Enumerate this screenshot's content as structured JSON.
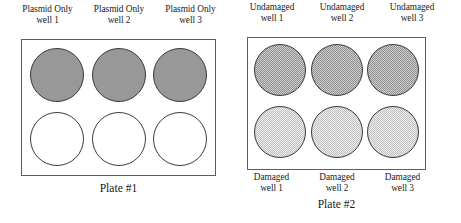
{
  "figure": {
    "type": "diagram",
    "background_color": "#ffffff"
  },
  "plate1": {
    "caption": "Plate #1",
    "border_color": "#5d5d5d",
    "headers": [
      {
        "line1": "Plasmid Only",
        "line2": "well 1"
      },
      {
        "line1": "Plasmid Only",
        "line2": "well 2"
      },
      {
        "line1": "Plasmid Only",
        "line2": "well 3"
      }
    ],
    "rows": [
      {
        "fill_style": "solid-gray",
        "fill_color": "#989898",
        "wells": [
          {
            "name": "plasmid-only-well-1",
            "fill": "solid-gray"
          },
          {
            "name": "plasmid-only-well-2",
            "fill": "solid-gray"
          },
          {
            "name": "plasmid-only-well-3",
            "fill": "solid-gray"
          }
        ]
      },
      {
        "fill_style": "white",
        "fill_color": "#ffffff",
        "wells": [
          {
            "name": "empty-well-1",
            "fill": "white"
          },
          {
            "name": "empty-well-2",
            "fill": "white"
          },
          {
            "name": "empty-well-3",
            "fill": "white"
          }
        ]
      }
    ]
  },
  "plate2": {
    "caption": "Plate #2",
    "border_color": "#5d5d5d",
    "headers": [
      {
        "line1": "Undamaged",
        "line2": "well 1"
      },
      {
        "line1": "Undamaged",
        "line2": "well 2"
      },
      {
        "line1": "Undamaged",
        "line2": "well 3"
      }
    ],
    "footers": [
      {
        "line1": "Damaged",
        "line2": "well 1"
      },
      {
        "line1": "Damaged",
        "line2": "well 2"
      },
      {
        "line1": "Damaged",
        "line2": "well 3"
      }
    ],
    "rows": [
      {
        "fill_style": "dither-50",
        "fill_color": "#b5b5b5",
        "wells": [
          {
            "name": "undamaged-well-1",
            "fill": "dither-50"
          },
          {
            "name": "undamaged-well-2",
            "fill": "dither-50"
          },
          {
            "name": "undamaged-well-3",
            "fill": "dither-50"
          }
        ]
      },
      {
        "fill_style": "dither-25",
        "fill_color": "#dcdcdc",
        "wells": [
          {
            "name": "damaged-well-1",
            "fill": "dither-25"
          },
          {
            "name": "damaged-well-2",
            "fill": "dither-25"
          },
          {
            "name": "damaged-well-3",
            "fill": "dither-25"
          }
        ]
      }
    ]
  }
}
